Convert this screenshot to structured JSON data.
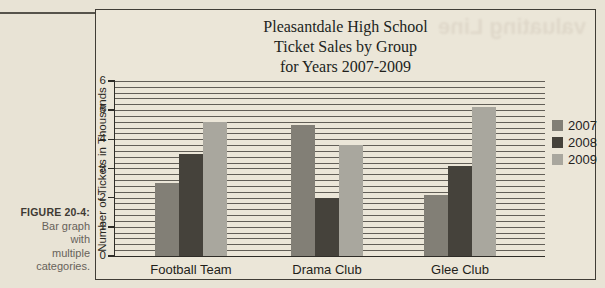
{
  "figure_caption": {
    "label": "FIGURE 20-4:",
    "lines": [
      "Bar graph",
      "with",
      "multiple",
      "categories."
    ]
  },
  "bleed_text": "valuating Line",
  "chart_data": {
    "type": "bar",
    "title_lines": [
      "Pleasantdale High School",
      "Ticket Sales by Group",
      "for Years 2007-2009"
    ],
    "ylabel": "Number of Tickets in Thousands",
    "categories": [
      "Football Team",
      "Drama Club",
      "Glee Club"
    ],
    "series": [
      {
        "name": "2007",
        "color": "#827f76",
        "values": [
          2.5,
          4.5,
          2.1
        ]
      },
      {
        "name": "2008",
        "color": "#45423b",
        "values": [
          3.5,
          2.0,
          3.1
        ]
      },
      {
        "name": "2009",
        "color": "#a9a79e",
        "values": [
          4.6,
          3.8,
          5.1
        ]
      }
    ],
    "ylim": [
      0,
      6
    ],
    "yticks": [
      0,
      1,
      2,
      3,
      4,
      5,
      6
    ],
    "minor_grid_step": 0.2,
    "grid": "on",
    "legend_position": "right"
  }
}
